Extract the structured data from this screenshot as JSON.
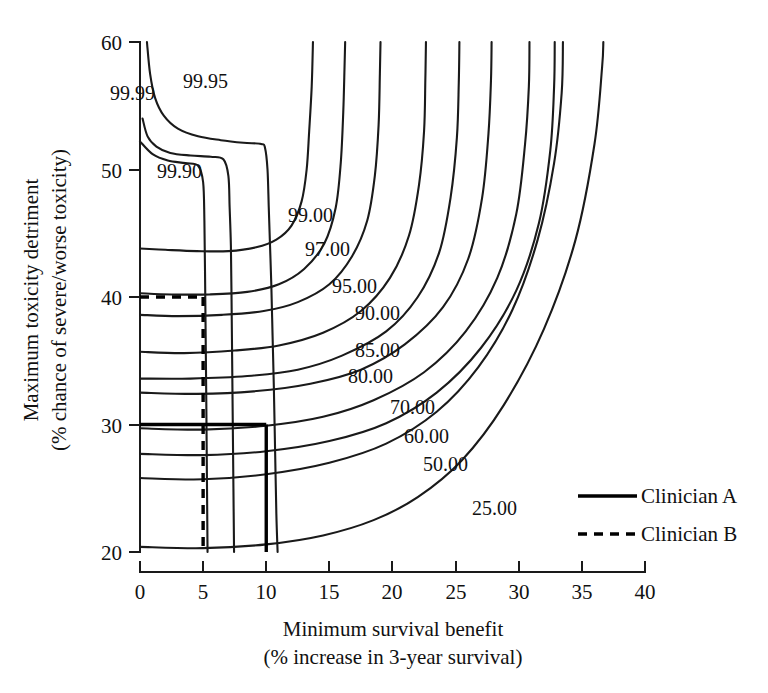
{
  "figure": {
    "title": "",
    "background": "#ffffff",
    "line_color": "#1a1a1a"
  },
  "axes": {
    "x": {
      "label_line1": "Minimum survival benefit",
      "label_line2": "(% increase in 3-year survival)",
      "ticks": [
        "0",
        "5",
        "10",
        "15",
        "20",
        "25",
        "30",
        "35",
        "40"
      ],
      "min": 0,
      "max": 40
    },
    "y": {
      "label_line1": "Maximum toxicity detriment",
      "label_line2": "(% chance of severe/worse toxicity)",
      "ticks": [
        "20",
        "30",
        "40",
        "50",
        "60"
      ],
      "min": 20,
      "max": 60
    }
  },
  "legend": {
    "items": [
      {
        "label": "Clinician A",
        "style": "solid"
      },
      {
        "label": "Clinician B",
        "style": "dashed"
      }
    ]
  },
  "chart_data": {
    "type": "line",
    "subtype": "contour",
    "title": "",
    "xlabel": "Minimum survival benefit (% increase in 3-year survival)",
    "ylabel": "Maximum toxicity detriment (% chance of severe/worse toxicity)",
    "xlim": [
      0,
      40
    ],
    "ylim": [
      20,
      60
    ],
    "grid": false,
    "legend_position": "center-right",
    "contour_levels": [
      "99.99",
      "99.95",
      "99.90",
      "99.00",
      "97.00",
      "95.00",
      "90.00",
      "85.00",
      "80.00",
      "70.00",
      "60.00",
      "50.00",
      "25.00"
    ],
    "contour_label_text": {
      "l9999": "99.99",
      "l9995": "99.95",
      "l9990": "99.90",
      "l9900": "99.00",
      "l9700": "97.00",
      "l9500": "95.00",
      "l9000": "90.00",
      "l8500": "85.00",
      "l8000": "80.00",
      "l7000": "70.00",
      "l6000": "60.00",
      "l5000": "50.00",
      "l2500": "25.00"
    },
    "series": [
      {
        "name": "99.99",
        "points": [
          [
            0.55,
            60.0
          ],
          [
            0.8,
            57.5
          ],
          [
            1.2,
            55.6
          ],
          [
            1.9,
            54.2
          ],
          [
            3.0,
            53.2
          ],
          [
            4.6,
            52.6
          ],
          [
            6.4,
            52.3
          ],
          [
            8.2,
            52.1
          ],
          [
            9.6,
            52.0
          ],
          [
            9.9,
            51.7
          ],
          [
            10.1,
            50.0
          ],
          [
            10.2,
            47.0
          ],
          [
            10.3,
            44.0
          ],
          [
            10.4,
            41.0
          ],
          [
            10.5,
            37.0
          ],
          [
            10.6,
            33.0
          ],
          [
            10.7,
            28.0
          ],
          [
            10.8,
            23.0
          ],
          [
            10.9,
            20.0
          ]
        ]
      },
      {
        "name": "99.95",
        "points": [
          [
            0.2,
            54.0
          ],
          [
            0.6,
            52.6
          ],
          [
            1.3,
            51.8
          ],
          [
            2.4,
            51.3
          ],
          [
            4.0,
            51.1
          ],
          [
            5.6,
            51.0
          ],
          [
            6.6,
            50.8
          ],
          [
            7.0,
            49.5
          ],
          [
            7.1,
            47.0
          ],
          [
            7.2,
            44.0
          ],
          [
            7.25,
            40.0
          ],
          [
            7.3,
            35.0
          ],
          [
            7.35,
            30.0
          ],
          [
            7.4,
            25.0
          ],
          [
            7.45,
            20.0
          ]
        ]
      },
      {
        "name": "99.90",
        "points": [
          [
            0.0,
            52.2
          ],
          [
            1.0,
            51.2
          ],
          [
            2.2,
            50.7
          ],
          [
            3.6,
            50.5
          ],
          [
            4.6,
            50.3
          ],
          [
            5.0,
            49.0
          ],
          [
            5.1,
            46.0
          ],
          [
            5.15,
            42.0
          ],
          [
            5.2,
            37.0
          ],
          [
            5.25,
            32.0
          ],
          [
            5.3,
            26.0
          ],
          [
            5.35,
            20.0
          ]
        ]
      },
      {
        "name": "99.00",
        "points": [
          [
            0.0,
            43.8
          ],
          [
            2.0,
            43.7
          ],
          [
            4.5,
            43.6
          ],
          [
            7.0,
            43.6
          ],
          [
            9.2,
            43.9
          ],
          [
            10.8,
            44.5
          ],
          [
            12.0,
            45.6
          ],
          [
            12.8,
            47.5
          ],
          [
            13.2,
            50.0
          ],
          [
            13.4,
            53.0
          ],
          [
            13.6,
            56.5
          ],
          [
            13.7,
            60.0
          ]
        ]
      },
      {
        "name": "97.00",
        "points": [
          [
            0.0,
            40.3
          ],
          [
            2.5,
            40.2
          ],
          [
            5.5,
            40.2
          ],
          [
            8.5,
            40.4
          ],
          [
            11.0,
            41.0
          ],
          [
            13.0,
            42.2
          ],
          [
            14.6,
            44.2
          ],
          [
            15.5,
            47.0
          ],
          [
            15.9,
            50.5
          ],
          [
            16.1,
            54.5
          ],
          [
            16.2,
            58.0
          ],
          [
            16.25,
            60.0
          ]
        ]
      },
      {
        "name": "95.00",
        "points": [
          [
            0.0,
            38.6
          ],
          [
            3.0,
            38.5
          ],
          [
            6.5,
            38.6
          ],
          [
            9.8,
            38.9
          ],
          [
            12.5,
            39.6
          ],
          [
            15.0,
            41.0
          ],
          [
            16.8,
            43.2
          ],
          [
            18.0,
            46.0
          ],
          [
            18.6,
            49.5
          ],
          [
            18.9,
            53.5
          ],
          [
            19.0,
            57.5
          ],
          [
            19.05,
            60.0
          ]
        ]
      },
      {
        "name": "90.00",
        "points": [
          [
            0.0,
            35.7
          ],
          [
            3.5,
            35.6
          ],
          [
            7.5,
            35.8
          ],
          [
            11.0,
            36.2
          ],
          [
            14.5,
            37.2
          ],
          [
            17.5,
            38.9
          ],
          [
            19.8,
            41.5
          ],
          [
            21.3,
            44.8
          ],
          [
            22.1,
            48.8
          ],
          [
            22.5,
            53.0
          ],
          [
            22.6,
            57.0
          ],
          [
            22.65,
            60.0
          ]
        ]
      },
      {
        "name": "85.00",
        "points": [
          [
            0.0,
            33.6
          ],
          [
            4.0,
            33.6
          ],
          [
            8.5,
            33.8
          ],
          [
            12.5,
            34.3
          ],
          [
            16.0,
            35.4
          ],
          [
            19.5,
            37.3
          ],
          [
            22.0,
            40.0
          ],
          [
            23.7,
            43.5
          ],
          [
            24.6,
            47.8
          ],
          [
            25.1,
            52.5
          ],
          [
            25.25,
            56.8
          ],
          [
            25.3,
            60.0
          ]
        ]
      },
      {
        "name": "80.00",
        "points": [
          [
            0.0,
            32.5
          ],
          [
            4.5,
            32.4
          ],
          [
            9.0,
            32.6
          ],
          [
            13.5,
            33.2
          ],
          [
            17.5,
            34.3
          ],
          [
            21.0,
            36.3
          ],
          [
            24.0,
            39.2
          ],
          [
            26.0,
            43.0
          ],
          [
            27.1,
            47.8
          ],
          [
            27.6,
            52.8
          ],
          [
            27.8,
            57.0
          ],
          [
            27.85,
            60.0
          ]
        ]
      },
      {
        "name": "70.00",
        "points": [
          [
            0.0,
            29.7
          ],
          [
            5.0,
            29.6
          ],
          [
            10.0,
            29.9
          ],
          [
            14.5,
            30.6
          ],
          [
            18.5,
            31.9
          ],
          [
            22.5,
            34.1
          ],
          [
            25.8,
            37.3
          ],
          [
            28.3,
            41.5
          ],
          [
            29.8,
            46.5
          ],
          [
            30.5,
            52.0
          ],
          [
            30.8,
            56.5
          ],
          [
            30.85,
            60.0
          ]
        ]
      },
      {
        "name": "60.00",
        "points": [
          [
            0.0,
            27.7
          ],
          [
            5.0,
            27.6
          ],
          [
            10.0,
            27.9
          ],
          [
            15.0,
            28.7
          ],
          [
            19.5,
            30.1
          ],
          [
            23.5,
            32.5
          ],
          [
            27.0,
            36.0
          ],
          [
            29.8,
            40.5
          ],
          [
            31.6,
            45.8
          ],
          [
            32.5,
            51.5
          ],
          [
            32.8,
            56.5
          ],
          [
            32.85,
            60.0
          ]
        ]
      },
      {
        "name": "50.00",
        "points": [
          [
            0.0,
            25.8
          ],
          [
            5.0,
            25.7
          ],
          [
            10.0,
            26.1
          ],
          [
            15.0,
            27.0
          ],
          [
            19.5,
            28.5
          ],
          [
            23.5,
            31.0
          ],
          [
            26.8,
            34.5
          ],
          [
            29.5,
            39.0
          ],
          [
            31.5,
            44.5
          ],
          [
            32.8,
            50.5
          ],
          [
            33.4,
            56.0
          ],
          [
            33.5,
            60.0
          ]
        ]
      },
      {
        "name": "25.00",
        "points": [
          [
            0.0,
            20.4
          ],
          [
            5.0,
            20.3
          ],
          [
            10.0,
            20.6
          ],
          [
            14.5,
            21.3
          ],
          [
            18.5,
            22.5
          ],
          [
            22.0,
            24.3
          ],
          [
            25.5,
            27.2
          ],
          [
            28.8,
            31.5
          ],
          [
            32.0,
            37.5
          ],
          [
            34.5,
            44.5
          ],
          [
            36.0,
            52.0
          ],
          [
            36.6,
            58.0
          ],
          [
            36.7,
            60.0
          ]
        ]
      }
    ],
    "annotations": [
      {
        "name": "clinician-a-threshold",
        "label": "Clinician A",
        "style": "solid",
        "x_threshold": 10,
        "y_threshold": 30
      },
      {
        "name": "clinician-b-threshold",
        "label": "Clinician B",
        "style": "dashed",
        "x_threshold": 5,
        "y_threshold": 40
      }
    ]
  }
}
